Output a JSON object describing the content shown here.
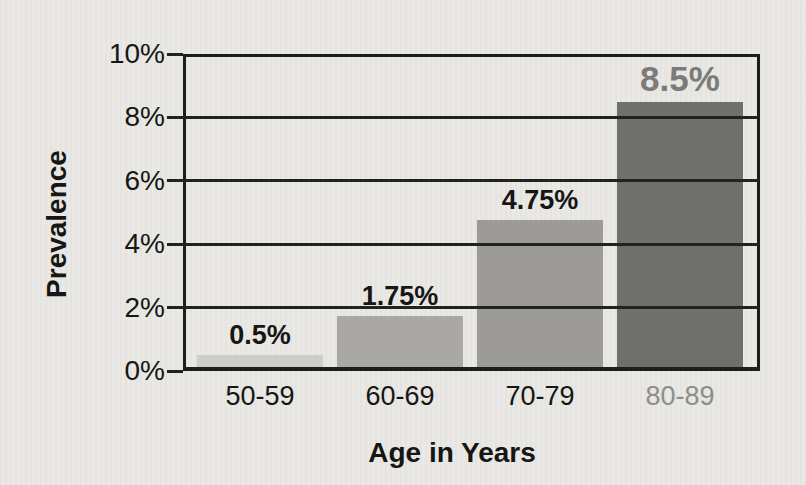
{
  "chart_data": {
    "type": "bar",
    "title": "",
    "xlabel": "Age in Years",
    "ylabel": "Prevalence",
    "categories": [
      "50-59",
      "60-69",
      "70-79",
      "80-89"
    ],
    "values": [
      0.5,
      1.75,
      4.75,
      8.5
    ],
    "value_labels": [
      "0.5%",
      "1.75%",
      "4.75%",
      "8.5%"
    ],
    "bar_colors": [
      "#cecdc9",
      "#a9a8a4",
      "#9c9b97",
      "#6f6f6d"
    ],
    "value_label_colors": [
      "#161614",
      "#161614",
      "#161614",
      "#7b7b79"
    ],
    "category_label_colors": [
      "#161614",
      "#161614",
      "#161614",
      "#8d8d8b"
    ],
    "highlight_index": 3,
    "ylim": [
      0,
      10
    ],
    "yticks": [
      0,
      2,
      4,
      6,
      8,
      10
    ],
    "ytick_labels": [
      "0%",
      "2%",
      "4%",
      "6%",
      "8%",
      "10%"
    ],
    "grid": "horizontal-over-bars",
    "legend": "none",
    "colors": {
      "background": "#e9e8e4",
      "line": "#1d1d1b",
      "highlight_text": "#7b7b79"
    }
  }
}
